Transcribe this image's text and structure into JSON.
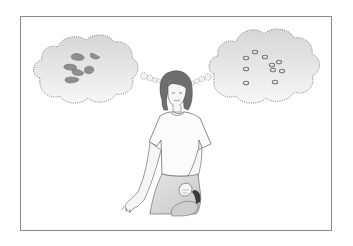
{
  "figure": {
    "frame": {
      "x": 20,
      "y": 16,
      "width": 312,
      "height": 215,
      "border_color": "#8a8a8a"
    },
    "left_bubble": {
      "content": "irregular-blobs",
      "blob_color": "#8e8e8e",
      "blobs": [
        {
          "cx": 78,
          "cy": 57,
          "rx": 7,
          "ry": 4,
          "rot": 20
        },
        {
          "cx": 95,
          "cy": 57,
          "rx": 5,
          "ry": 3,
          "rot": -30
        },
        {
          "cx": 70,
          "cy": 68,
          "rx": 7,
          "ry": 4,
          "rot": 10
        },
        {
          "cx": 78,
          "cy": 72,
          "rx": 6,
          "ry": 3,
          "rot": 30
        },
        {
          "cx": 89,
          "cy": 70,
          "rx": 5,
          "ry": 4,
          "rot": -20
        },
        {
          "cx": 72,
          "cy": 80,
          "rx": 7,
          "ry": 3,
          "rot": -10
        }
      ]
    },
    "right_bubble": {
      "content": "ring-particles",
      "ring_color": "#7a7a7a",
      "rings": [
        {
          "cx": 255,
          "cy": 52
        },
        {
          "cx": 265,
          "cy": 57
        },
        {
          "cx": 246,
          "cy": 58
        },
        {
          "cx": 279,
          "cy": 62
        },
        {
          "cx": 272,
          "cy": 65
        },
        {
          "cx": 246,
          "cy": 69
        },
        {
          "cx": 273,
          "cy": 70
        },
        {
          "cx": 282,
          "cy": 71
        },
        {
          "cx": 246,
          "cy": 83
        },
        {
          "cx": 275,
          "cy": 82
        }
      ]
    },
    "colors": {
      "cloud_fill_top": "#d8d8d8",
      "cloud_fill_bottom": "#f6f6f6",
      "cloud_outline": "#6a6a6a",
      "hair": "#6e6e6e",
      "line": "#5a5a5a",
      "skin": "#f4f4f4"
    }
  }
}
